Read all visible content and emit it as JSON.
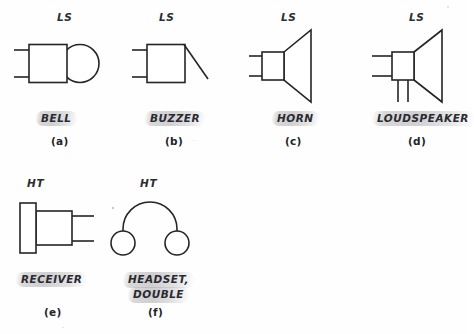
{
  "page": {
    "background_color": "#fefefe",
    "ink_color": "#24242a",
    "highlight_color": "#b4b4b8",
    "kind": "schematic-symbol-plate"
  },
  "symbols": [
    {
      "id": "bell",
      "tag": "LS",
      "name": "BELL",
      "caption": "(a)",
      "shape": "square-with-circle",
      "leads": 2
    },
    {
      "id": "buzzer",
      "tag": "LS",
      "name": "BUZZER",
      "caption": "(b)",
      "shape": "square-with-diagonal",
      "leads": 2
    },
    {
      "id": "horn",
      "tag": "LS",
      "name": "HORN",
      "caption": "(c)",
      "shape": "rectangle-with-flared-cone",
      "leads": 2
    },
    {
      "id": "loudspeaker",
      "tag": "LS",
      "name": "LOUDSPEAKER",
      "caption": "(d)",
      "shape": "rectangle-with-flared-cone-and-bottom-leads",
      "leads": 4
    },
    {
      "id": "receiver",
      "tag": "HT",
      "name": "RECEIVER",
      "caption": "(e)",
      "shape": "earpiece-bar-with-body",
      "leads": 2
    },
    {
      "id": "headset-double",
      "tag": "HT",
      "name_line1": "HEADSET,",
      "name_line2": "DOUBLE",
      "caption": "(f)",
      "shape": "arch-with-two-circles",
      "leads": 0
    }
  ]
}
